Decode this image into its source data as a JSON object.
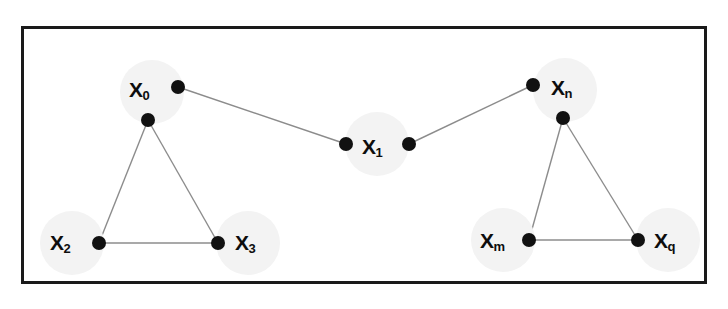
{
  "figure": {
    "kind": "graph-diagram",
    "frame": {
      "border_color": "#1a1a1a",
      "background": "#ffffff"
    },
    "halo_color": "#f3f3f3",
    "dot_color": "#111111",
    "edge_color": "#8c8c8c",
    "nodes": [
      {
        "id": "x0",
        "name": "X",
        "subscript": "0",
        "label_x": 129,
        "label_y": 79,
        "halo_cx": 152,
        "halo_cy": 92,
        "halo_r": 32,
        "vertices": [
          {
            "vid": "x0-right",
            "cx": 178,
            "cy": 87,
            "r": 7
          },
          {
            "vid": "x0-bottom",
            "cx": 148,
            "cy": 120,
            "r": 7
          }
        ]
      },
      {
        "id": "x1",
        "name": "X",
        "subscript": "1",
        "label_x": 362,
        "label_y": 136,
        "halo_cx": 377,
        "halo_cy": 144,
        "halo_r": 32,
        "vertices": [
          {
            "vid": "x1-left",
            "cx": 346,
            "cy": 144,
            "r": 7
          },
          {
            "vid": "x1-right",
            "cx": 409,
            "cy": 144,
            "r": 7
          }
        ]
      },
      {
        "id": "xn",
        "name": "X",
        "subscript": "n",
        "label_x": 551,
        "label_y": 77,
        "halo_cx": 565,
        "halo_cy": 90,
        "halo_r": 32,
        "vertices": [
          {
            "vid": "xn-left",
            "cx": 533,
            "cy": 85,
            "r": 7
          },
          {
            "vid": "xn-bottom",
            "cx": 563,
            "cy": 118,
            "r": 7
          }
        ]
      },
      {
        "id": "x2",
        "name": "X",
        "subscript": "2",
        "label_x": 50,
        "label_y": 232,
        "halo_cx": 72,
        "halo_cy": 243,
        "halo_r": 32,
        "vertices": [
          {
            "vid": "x2-right",
            "cx": 99,
            "cy": 243,
            "r": 7
          }
        ]
      },
      {
        "id": "x3",
        "name": "X",
        "subscript": "3",
        "label_x": 235,
        "label_y": 232,
        "halo_cx": 248,
        "halo_cy": 243,
        "halo_r": 32,
        "vertices": [
          {
            "vid": "x3-left",
            "cx": 218,
            "cy": 243,
            "r": 7
          }
        ]
      },
      {
        "id": "xm",
        "name": "X",
        "subscript": "m",
        "label_x": 480,
        "label_y": 230,
        "halo_cx": 503,
        "halo_cy": 240,
        "halo_r": 32,
        "vertices": [
          {
            "vid": "xm-right",
            "cx": 529,
            "cy": 240,
            "r": 7
          }
        ]
      },
      {
        "id": "xq",
        "name": "X",
        "subscript": "q",
        "label_x": 654,
        "label_y": 230,
        "halo_cx": 668,
        "halo_cy": 240,
        "halo_r": 32,
        "vertices": [
          {
            "vid": "xq-left",
            "cx": 638,
            "cy": 240,
            "r": 7
          }
        ]
      }
    ],
    "edges": [
      {
        "eid": "edge-x0-x1",
        "x1": 178,
        "y1": 87,
        "x2": 346,
        "y2": 144
      },
      {
        "eid": "edge-x1-xn",
        "x1": 409,
        "y1": 144,
        "x2": 533,
        "y2": 85
      },
      {
        "eid": "edge-x0-x2",
        "x1": 148,
        "y1": 120,
        "x2": 99,
        "y2": 243
      },
      {
        "eid": "edge-x0-x3",
        "x1": 148,
        "y1": 120,
        "x2": 218,
        "y2": 243
      },
      {
        "eid": "edge-x2-x3",
        "x1": 99,
        "y1": 243,
        "x2": 218,
        "y2": 243
      },
      {
        "eid": "edge-xn-xm",
        "x1": 563,
        "y1": 118,
        "x2": 529,
        "y2": 240
      },
      {
        "eid": "edge-xn-xq",
        "x1": 563,
        "y1": 118,
        "x2": 638,
        "y2": 240
      },
      {
        "eid": "edge-xm-xq",
        "x1": 529,
        "y1": 240,
        "x2": 638,
        "y2": 240
      }
    ]
  }
}
